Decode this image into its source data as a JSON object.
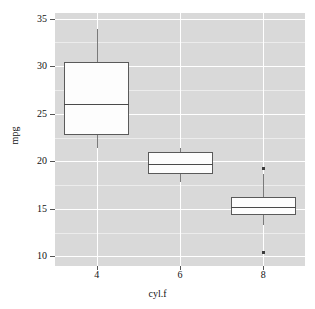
{
  "chart_data": {
    "type": "box",
    "title": "",
    "xlabel": "cyl.f",
    "ylabel": "mpg",
    "categories": [
      "4",
      "6",
      "8"
    ],
    "ylim": [
      9.0,
      35.6
    ],
    "yticks": [
      10,
      15,
      20,
      25,
      30,
      35
    ],
    "yticklabels": [
      "10",
      "15",
      "20",
      "25",
      "30",
      "35"
    ],
    "grid": true,
    "grid_color": "#ffffff",
    "panel_background": "#d9d9d9",
    "box_fill": "#fdfdfd",
    "box_border": "#5a5a5a",
    "legend": null,
    "boxes": [
      {
        "category": "4",
        "whisker_low": 21.4,
        "q1": 22.8,
        "median": 26.0,
        "q3": 30.4,
        "whisker_high": 33.9,
        "outliers": []
      },
      {
        "category": "6",
        "whisker_low": 17.8,
        "q1": 18.65,
        "median": 19.7,
        "q3": 21.0,
        "whisker_high": 21.4,
        "outliers": []
      },
      {
        "category": "8",
        "whisker_low": 13.3,
        "q1": 14.4,
        "median": 15.2,
        "q3": 16.25,
        "whisker_high": 18.7,
        "outliers": [
          19.2,
          10.4
        ]
      }
    ]
  },
  "axis": {
    "y_title": "mpg",
    "x_title": "cyl.f",
    "y_tick_labels": [
      "35",
      "30",
      "25",
      "20",
      "15",
      "10"
    ],
    "x_tick_labels": [
      "4",
      "6",
      "8"
    ]
  }
}
